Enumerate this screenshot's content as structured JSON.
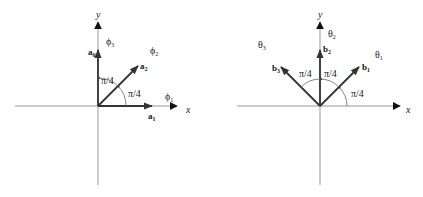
{
  "diagrams": [
    {
      "name": "left",
      "axis_x_label": "x",
      "axis_y_label": "y",
      "vectors": [
        {
          "label": "a",
          "sub": "1",
          "angle_deg": 0
        },
        {
          "label": "a",
          "sub": "2",
          "angle_deg": 45
        },
        {
          "label": "a",
          "sub": "0",
          "angle_deg": 90
        }
      ],
      "phases": [
        {
          "label": "ϕ",
          "sub": "1"
        },
        {
          "label": "ϕ",
          "sub": "2"
        },
        {
          "label": "ϕ",
          "sub": "3"
        }
      ],
      "angles": [
        "π/4",
        "π/4"
      ]
    },
    {
      "name": "right",
      "axis_x_label": "x",
      "axis_y_label": "y",
      "vectors": [
        {
          "label": "b",
          "sub": "1",
          "angle_deg": 45
        },
        {
          "label": "b",
          "sub": "2",
          "angle_deg": 90
        },
        {
          "label": "b",
          "sub": "3",
          "angle_deg": 135
        }
      ],
      "phases": [
        {
          "label": "θ",
          "sub": "1"
        },
        {
          "label": "θ",
          "sub": "2"
        },
        {
          "label": "θ",
          "sub": "3"
        }
      ],
      "angles": [
        "π/4",
        "π/4",
        "π/4"
      ]
    }
  ]
}
